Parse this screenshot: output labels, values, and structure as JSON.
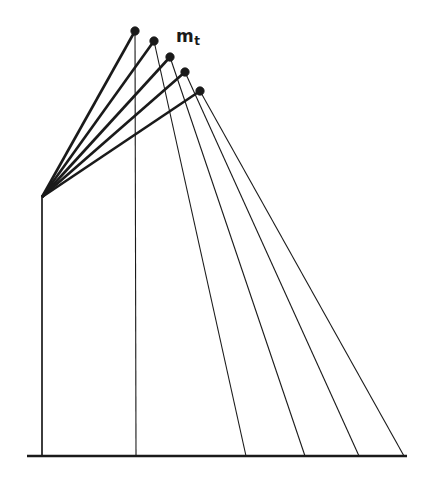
{
  "figure": {
    "name": "rotating-beam-with-tip-mass-diagram",
    "background_color": "#ffffff",
    "stroke_color": "#1a1a1a",
    "width": 423,
    "height": 481,
    "labels": [
      {
        "id": "tip-mass",
        "text_base": "m",
        "text_sub": "t",
        "x": 176,
        "y": 28
      }
    ],
    "pivot": {
      "label": "pivot",
      "x": 42,
      "y": 197
    },
    "ground": {
      "label": "ground-baseline",
      "x1": 27,
      "y1": 456,
      "x2": 407,
      "y2": 456,
      "stroke_width": 2.4
    },
    "beams": [
      {
        "id": "beam-1",
        "tip_x": 135,
        "tip_y": 31,
        "stroke_width": 2.6
      },
      {
        "id": "beam-2",
        "tip_x": 154,
        "tip_y": 41,
        "stroke_width": 2.6
      },
      {
        "id": "beam-3",
        "tip_x": 170,
        "tip_y": 57,
        "stroke_width": 2.6
      },
      {
        "id": "beam-4",
        "tip_x": 185,
        "tip_y": 72,
        "stroke_width": 2.6
      },
      {
        "id": "beam-5",
        "tip_x": 200,
        "tip_y": 91,
        "stroke_width": 2.6
      }
    ],
    "tip_masses": [
      {
        "id": "mass-1",
        "cx": 135,
        "cy": 31,
        "r": 4.2
      },
      {
        "id": "mass-2",
        "cx": 154,
        "cy": 41,
        "r": 4.2
      },
      {
        "id": "mass-3",
        "cx": 170,
        "cy": 57,
        "r": 4.2
      },
      {
        "id": "mass-4",
        "cx": 185,
        "cy": 72,
        "r": 4.2
      },
      {
        "id": "mass-5",
        "cx": 200,
        "cy": 91,
        "r": 4.2
      }
    ],
    "droplines": [
      {
        "id": "dropline-0",
        "x1": 42,
        "y1": 197,
        "x2": 42,
        "y2": 456,
        "stroke_width": 1.7
      },
      {
        "id": "dropline-1",
        "x1": 135,
        "y1": 31,
        "x2": 136,
        "y2": 456,
        "stroke_width": 1.1
      },
      {
        "id": "dropline-2",
        "x1": 154,
        "y1": 41,
        "x2": 246,
        "y2": 456,
        "stroke_width": 1.1
      },
      {
        "id": "dropline-3",
        "x1": 170,
        "y1": 57,
        "x2": 305,
        "y2": 456,
        "stroke_width": 1.1
      },
      {
        "id": "dropline-4",
        "x1": 185,
        "y1": 72,
        "x2": 359,
        "y2": 456,
        "stroke_width": 1.1
      },
      {
        "id": "dropline-5",
        "x1": 200,
        "y1": 91,
        "x2": 404,
        "y2": 456,
        "stroke_width": 1.1
      }
    ]
  }
}
